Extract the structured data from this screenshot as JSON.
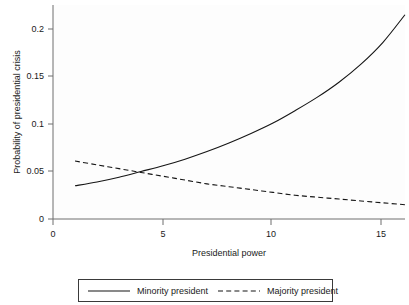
{
  "chart_data": {
    "type": "line",
    "title": "",
    "xlabel": "Presidential power",
    "ylabel": "Probability of presidential crisis",
    "xlim": [
      0,
      16.6
    ],
    "ylim": [
      0,
      0.225
    ],
    "xticks": [
      0,
      5,
      10,
      15
    ],
    "xticklabels": [
      "0",
      "5",
      "10",
      "15"
    ],
    "yticks": [
      0,
      0.05,
      0.1,
      0.15,
      0.2
    ],
    "yticklabels": [
      "0",
      "0.05",
      "0.1",
      "0.15",
      "0.2"
    ],
    "grid": false,
    "legend_position": "below",
    "x": [
      1,
      2,
      3,
      4,
      5,
      6,
      7,
      8,
      9,
      10,
      11,
      12,
      13,
      14,
      15,
      16
    ],
    "series": [
      {
        "name": "Minority president",
        "style": "solid",
        "color": "#151515",
        "values": [
          0.035,
          0.039,
          0.044,
          0.05,
          0.056,
          0.063,
          0.071,
          0.08,
          0.09,
          0.101,
          0.114,
          0.128,
          0.144,
          0.163,
          0.186,
          0.215
        ]
      },
      {
        "name": "Majority president",
        "style": "dashed",
        "color": "#151515",
        "values": [
          0.061,
          0.057,
          0.053,
          0.049,
          0.045,
          0.041,
          0.037,
          0.034,
          0.031,
          0.028,
          0.025,
          0.023,
          0.021,
          0.019,
          0.017,
          0.015
        ]
      }
    ],
    "annotations": {
      "crossover_x": 3.6,
      "crossover_y": 0.048
    }
  },
  "legend": {
    "entries": [
      {
        "label": "Minority president",
        "style": "solid"
      },
      {
        "label": "Majority president",
        "style": "dashed"
      }
    ]
  }
}
